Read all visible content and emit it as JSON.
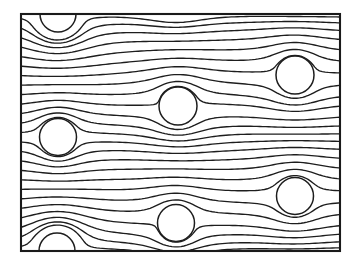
{
  "figure": {
    "kind": "streamline-field-diagram",
    "canvas": {
      "width": 351,
      "height": 269
    },
    "background_color": "#ffffff",
    "line_color": "#1d1d1d",
    "frame_color": "#1a1a1a"
  },
  "frame": {
    "name": "plot-border",
    "x": 21,
    "y": 14,
    "width": 319,
    "height": 237,
    "stroke_width": 2.1
  },
  "chart_data": {
    "type": "line",
    "subtitle": "",
    "xlabel": "",
    "ylabel": "",
    "xlim": [
      21,
      340
    ],
    "ylim": [
      14,
      251
    ],
    "grid": false,
    "legend": null,
    "annotations": [],
    "tick_labels": {
      "x": [],
      "y": []
    },
    "flow": {
      "direction": "left-to-right",
      "uniform_speed": 1.0,
      "streamline_count": 25,
      "streamline_stroke_width": 1.35,
      "inlet_x": 21,
      "outlet_x": 340,
      "inlet_y_start": 14,
      "inlet_y_end": 251,
      "integration_step_px": 1.0
    },
    "obstacles": [
      {
        "id": "circle-top-left",
        "cx": 58,
        "cy": 14,
        "r": 18.0,
        "clipped_by": "top-border"
      },
      {
        "id": "circle-top-right",
        "cx": 295,
        "cy": 75,
        "r": 19.0,
        "clipped_by": null
      },
      {
        "id": "circle-center",
        "cx": 178,
        "cy": 106,
        "r": 19.0,
        "clipped_by": null
      },
      {
        "id": "circle-mid-left",
        "cx": 58,
        "cy": 137,
        "r": 18.5,
        "clipped_by": null
      },
      {
        "id": "circle-lower-right",
        "cx": 295,
        "cy": 196,
        "r": 18.5,
        "clipped_by": null
      },
      {
        "id": "circle-lower-center",
        "cx": 176,
        "cy": 223,
        "r": 18.5,
        "clipped_by": null
      },
      {
        "id": "circle-bottom-left",
        "cx": 57,
        "cy": 251,
        "r": 18.0,
        "clipped_by": "bottom-border"
      }
    ]
  }
}
